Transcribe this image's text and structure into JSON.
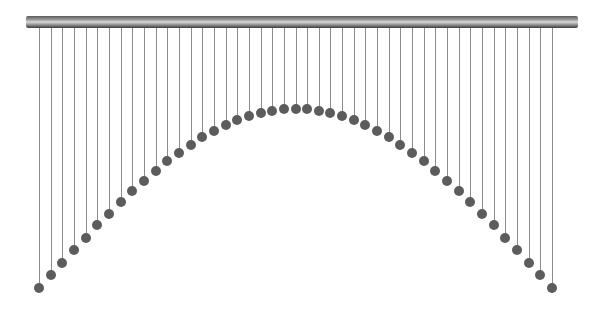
{
  "scene": {
    "title": "",
    "bar": {
      "x": 26,
      "y": 16,
      "width": 552,
      "height": 12
    },
    "pendulum_count": 45,
    "first_x": 39,
    "last_x": 552,
    "end_y": 288,
    "peak_y": 109,
    "colors": {
      "background": "#ffffff",
      "string": "#8c8c8c",
      "ball": "#5c5c5c",
      "bar_dark": "#3c3c3c",
      "bar_light": "#d8d8d8"
    }
  }
}
